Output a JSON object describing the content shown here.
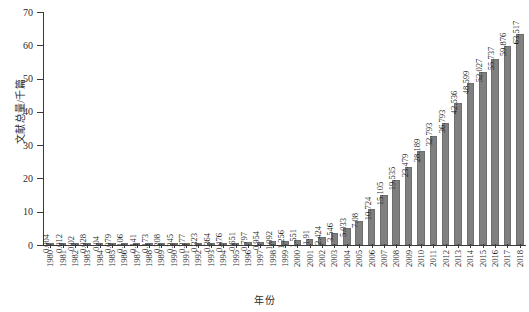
{
  "chart_data": {
    "type": "bar",
    "title": "",
    "xlabel": "年份",
    "ylabel": "文献总量/千篇",
    "ylim": [
      0,
      70
    ],
    "yticks": [
      0,
      10,
      20,
      30,
      40,
      50,
      60,
      70
    ],
    "grid": false,
    "legend": null,
    "bar_color": "#808080",
    "axis_color": "#3a3a3a",
    "categories": [
      "1980",
      "1981",
      "1982",
      "1983",
      "1984",
      "1985",
      "1986",
      "1987",
      "1988",
      "1989",
      "1990",
      "1991",
      "1992",
      "1993",
      "1994",
      "1995",
      "1996",
      "1997",
      "1998",
      "1999",
      "2000",
      "2001",
      "2002",
      "2003",
      "2004",
      "2005",
      "2006",
      "2007",
      "2008",
      "2009",
      "2010",
      "2011",
      "2012",
      "2013",
      "2014",
      "2015",
      "2016",
      "2017",
      "2018"
    ],
    "values": [
      0.004,
      0.012,
      0.02,
      0.028,
      0.04,
      0.079,
      0.106,
      0.141,
      0.173,
      0.208,
      0.245,
      0.277,
      0.323,
      0.364,
      0.476,
      0.651,
      0.797,
      0.954,
      1.092,
      1.256,
      1.551,
      1.91,
      2.424,
      3.546,
      5.033,
      7.08,
      10.724,
      15.105,
      19.535,
      23.479,
      28.189,
      32.793,
      36.793,
      42.536,
      48.599,
      52.027,
      55.737,
      59.876,
      63.517
    ],
    "value_labels": [
      "0.004",
      "0.012",
      "0.02",
      "0.028",
      "0.04",
      "0.079",
      "0.106",
      "0.141",
      "0.173",
      "0.208",
      "0.245",
      "0.277",
      "0.323",
      "0.364",
      "0.476",
      "0.651",
      "0.797",
      "0.954",
      "1.092",
      "1.256",
      "1.551",
      "1.91",
      "2.424",
      "3.546",
      "5.033",
      "7.08",
      "10.724",
      "15.105",
      "19.535",
      "23.479",
      "28.189",
      "32.793",
      "36.793",
      "42.536",
      "48.599",
      "52.027",
      "55.737",
      "59.876",
      "63.517"
    ]
  }
}
